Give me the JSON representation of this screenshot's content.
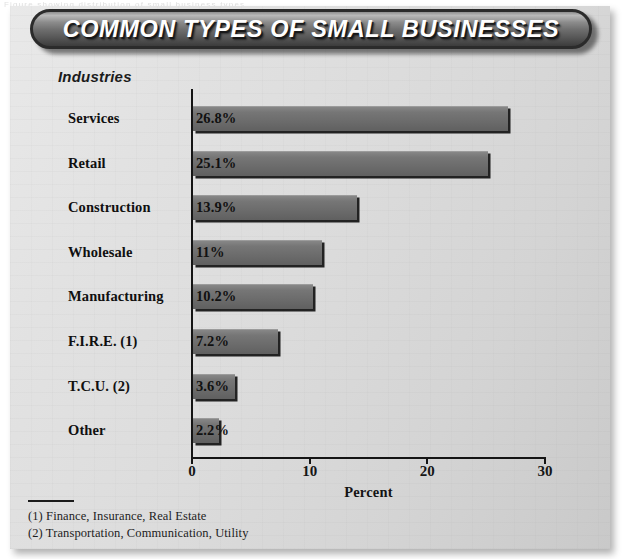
{
  "figure": {
    "title": "COMMON TYPES OF SMALL BUSINESSES",
    "group_header": "Industries",
    "top_bleed_text": "Figure showing distribution of small business types"
  },
  "chart_data": {
    "type": "bar",
    "orientation": "horizontal",
    "title": "COMMON TYPES OF SMALL BUSINESSES",
    "categories": [
      "Services",
      "Retail",
      "Construction",
      "Wholesale",
      "Manufacturing",
      "F.I.R.E. (1)",
      "T.C.U. (2)",
      "Other"
    ],
    "values": [
      26.8,
      25.1,
      13.9,
      11,
      10.2,
      7.2,
      3.6,
      2.2
    ],
    "value_labels": [
      "26.8%",
      "25.1%",
      "13.9%",
      "11%",
      "10.2%",
      "7.2%",
      "3.6%",
      "2.2%"
    ],
    "xlabel": "Percent",
    "ylabel": "Industries",
    "xlim": [
      0,
      30
    ],
    "xticks": [
      0,
      10,
      20,
      30
    ],
    "xtick_labels": [
      "0",
      "10",
      "20",
      "30"
    ],
    "grid": false,
    "legend": false,
    "series_color": "#6f6f6f"
  },
  "footnotes": [
    "(1) Finance, Insurance, Real Estate",
    "(2) Transportation, Communication, Utility"
  ],
  "colors": {
    "page_background": "#dcdcdc",
    "title_bar": "#5a5a5a",
    "title_text": "#ffffff",
    "bar_fill": "#6f6f6f",
    "axis": "#141414",
    "text": "#111111"
  }
}
